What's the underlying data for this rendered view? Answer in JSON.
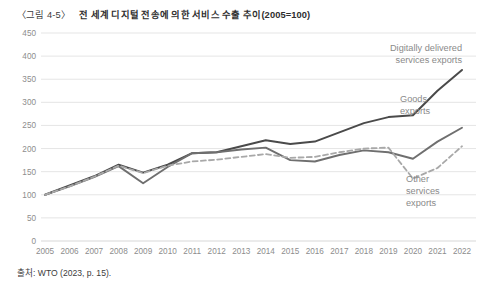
{
  "caption": {
    "number": "〈그림 4-5〉",
    "title": "전 세계 디지털 전송에 의한 서비스 수출 추이(2005=100)"
  },
  "source": "출처: WTO (2023, p. 15).",
  "colors": {
    "digital_line": "#4a4a4a",
    "goods_line": "#6f6f6f",
    "other_line": "#a8a8a8",
    "gridline": "#e2e2e2",
    "tick_label": "#8d8d8d",
    "annotation_label": "#8a8a8a",
    "background": "#ffffff"
  },
  "annotations": {
    "digital": {
      "line1": "Digitally delivered",
      "line2": "services exports"
    },
    "goods": {
      "line1": "Goods",
      "line2": "exports"
    },
    "other": {
      "line1": "Other",
      "line2": "services",
      "line3": "exports"
    }
  },
  "chart_data": {
    "type": "line",
    "title": "전 세계 디지털 전송에 의한 서비스 수출 추이(2005=100)",
    "xlabel": "",
    "ylabel": "",
    "ylim": [
      0,
      450
    ],
    "xlim": [
      2005,
      2022
    ],
    "yticks": [
      0,
      50,
      100,
      150,
      200,
      250,
      300,
      350,
      400,
      450
    ],
    "ytick_labels": [
      "0",
      "50",
      "100",
      "150",
      "200",
      "250",
      "300",
      "350",
      "400",
      "450"
    ],
    "grid": true,
    "grid_axis": "y",
    "legend_position": "inline-annotations",
    "index_base": {
      "year": 2005,
      "value": 100
    },
    "x": [
      2005,
      2006,
      2007,
      2008,
      2009,
      2010,
      2011,
      2012,
      2013,
      2014,
      2015,
      2016,
      2017,
      2018,
      2019,
      2020,
      2021,
      2022
    ],
    "categories": [
      "2005",
      "2006",
      "2007",
      "2008",
      "2009",
      "2010",
      "2011",
      "2012",
      "2013",
      "2014",
      "2015",
      "2016",
      "2017",
      "2018",
      "2019",
      "2020",
      "2021",
      "2022"
    ],
    "series": [
      {
        "name": "Digitally delivered services exports",
        "style": "solid",
        "color": "#4a4a4a",
        "values": [
          100,
          120,
          140,
          165,
          148,
          165,
          190,
          192,
          205,
          218,
          210,
          215,
          235,
          255,
          268,
          272,
          325,
          370
        ]
      },
      {
        "name": "Goods exports",
        "style": "solid",
        "color": "#6f6f6f",
        "values": [
          100,
          118,
          138,
          162,
          125,
          160,
          190,
          192,
          198,
          202,
          175,
          172,
          186,
          196,
          192,
          178,
          215,
          245
        ]
      },
      {
        "name": "Other services exports",
        "style": "dashed",
        "color": "#a8a8a8",
        "values": [
          100,
          118,
          139,
          163,
          147,
          163,
          172,
          176,
          182,
          188,
          180,
          182,
          192,
          200,
          202,
          135,
          158,
          205
        ]
      }
    ]
  }
}
